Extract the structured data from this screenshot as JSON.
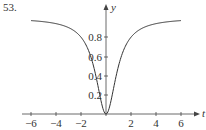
{
  "problem_number": "53.",
  "chart_data": {
    "type": "line",
    "title": "",
    "xlabel": "t",
    "ylabel": "y",
    "function": "y = t^2 / (1 + t^2)",
    "x": [
      -6,
      -5,
      -4,
      -3,
      -2,
      -1.5,
      -1,
      -0.5,
      0,
      0.5,
      1,
      1.5,
      2,
      3,
      4,
      5,
      6
    ],
    "series": [
      {
        "name": "curve",
        "values": [
          0.973,
          0.962,
          0.941,
          0.9,
          0.8,
          0.692,
          0.5,
          0.2,
          0,
          0.2,
          0.5,
          0.692,
          0.8,
          0.9,
          0.941,
          0.962,
          0.973
        ]
      }
    ],
    "x_ticks": [
      "−6",
      "−4",
      "−2",
      "2",
      "4",
      "6"
    ],
    "y_ticks": [
      "0.2",
      "0.4",
      "0.6",
      "0.8"
    ],
    "xlim": [
      -6.5,
      7
    ],
    "ylim": [
      0,
      1.05
    ],
    "grid": false,
    "legend": "none"
  }
}
